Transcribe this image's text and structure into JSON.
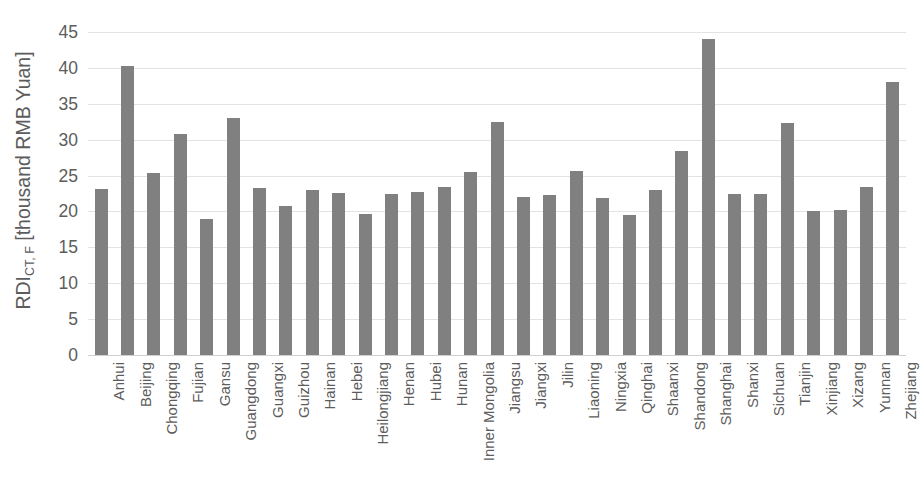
{
  "chart_data": {
    "type": "bar",
    "title": "",
    "subtitle": "",
    "xlabel": "",
    "ylabel": "RDI_CT,F [thousand RMB Yuan]",
    "ylabel_main": "RDI",
    "ylabel_sub": "CT, F",
    "ylabel_unit": " [thousand RMB Yuan]",
    "ylim": [
      0,
      45
    ],
    "ytick_step": 5,
    "yticks": [
      45,
      40,
      35,
      30,
      25,
      20,
      15,
      10,
      5,
      0
    ],
    "ytick_labels": [
      "45",
      "40",
      "35",
      "30",
      "25",
      "20",
      "15",
      "10",
      "5",
      "0"
    ],
    "grid": true,
    "grid_axis": "y",
    "legend": false,
    "legend_position": "none",
    "bar_color": "#808080",
    "gridline_color": "#e3e3e3",
    "text_color": "#5c5c5c",
    "background": "#ffffff",
    "categories": [
      "Anhui",
      "Beijing",
      "Chongqing",
      "Fujian",
      "Gansu",
      "Guangdong",
      "Guangxi",
      "Guizhou",
      "Hainan",
      "Hebei",
      "Heilongjiang",
      "Henan",
      "Hubei",
      "Hunan",
      "Inner Mongolia",
      "Jiangsu",
      "Jiangxi",
      "Jilin",
      "Liaoning",
      "Ningxia",
      "Qinghai",
      "Shaanxi",
      "Shandong",
      "Shanghai",
      "Shanxi",
      "Sichuan",
      "Tianjin",
      "Xinjiang",
      "Xizang",
      "Yunnan",
      "Zhejiang"
    ],
    "values": [
      23.1,
      40.3,
      25.3,
      30.8,
      18.9,
      33.0,
      23.3,
      20.7,
      23.0,
      22.6,
      19.6,
      22.5,
      22.7,
      23.4,
      25.5,
      32.5,
      22.0,
      22.3,
      25.6,
      21.9,
      19.5,
      23.0,
      28.4,
      44.0,
      22.5,
      22.5,
      32.3,
      20.1,
      20.2,
      23.4,
      38.0
    ]
  }
}
